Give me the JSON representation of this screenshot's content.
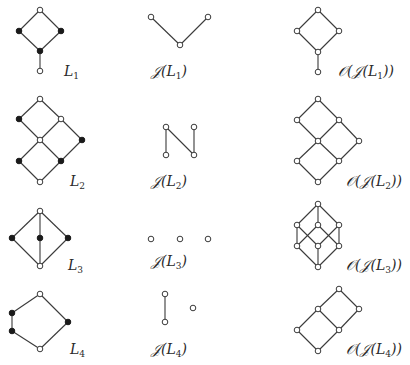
{
  "figure": {
    "rows": [
      {
        "lattice": {
          "name": "L_1",
          "label_main": "L",
          "label_sub": "1",
          "label_pos": [
            64,
            64
          ],
          "nodes": [
            {
              "x": 40,
              "y": 10,
              "filled": false
            },
            {
              "x": 19,
              "y": 31,
              "filled": true
            },
            {
              "x": 61,
              "y": 31,
              "filled": true
            },
            {
              "x": 40,
              "y": 51,
              "filled": true
            },
            {
              "x": 40,
              "y": 71,
              "filled": false
            }
          ],
          "edges": [
            [
              0,
              1
            ],
            [
              0,
              2
            ],
            [
              1,
              3
            ],
            [
              2,
              3
            ],
            [
              3,
              4
            ]
          ]
        },
        "join_irreducibles": {
          "label_prefix": "𝒥(L",
          "label_sub": "1",
          "label_suffix": ")",
          "label_pos": [
            151,
            64
          ],
          "nodes": [
            {
              "x": 151,
              "y": 17,
              "filled": false
            },
            {
              "x": 180,
              "y": 45,
              "filled": false
            },
            {
              "x": 208,
              "y": 17,
              "filled": false
            }
          ],
          "edges": [
            [
              0,
              1
            ],
            [
              1,
              2
            ]
          ]
        },
        "down_sets": {
          "label_prefix": "𝒪(𝒥(L",
          "label_sub": "1",
          "label_suffix": "))",
          "label_pos": [
            338,
            64
          ],
          "nodes": [
            {
              "x": 318,
              "y": 10,
              "filled": false
            },
            {
              "x": 297,
              "y": 31,
              "filled": false
            },
            {
              "x": 339,
              "y": 31,
              "filled": false
            },
            {
              "x": 318,
              "y": 52,
              "filled": false
            },
            {
              "x": 318,
              "y": 72,
              "filled": false
            }
          ],
          "edges": [
            [
              0,
              1
            ],
            [
              0,
              2
            ],
            [
              1,
              3
            ],
            [
              2,
              3
            ],
            [
              3,
              4
            ]
          ]
        }
      },
      {
        "lattice": {
          "name": "L_2",
          "label_main": "L",
          "label_sub": "2",
          "label_pos": [
            70,
            174
          ],
          "nodes": [
            {
              "x": 40,
              "y": 99,
              "filled": false
            },
            {
              "x": 19,
              "y": 119,
              "filled": true
            },
            {
              "x": 61,
              "y": 119,
              "filled": false
            },
            {
              "x": 40,
              "y": 140,
              "filled": false
            },
            {
              "x": 82,
              "y": 140,
              "filled": true
            },
            {
              "x": 19,
              "y": 161,
              "filled": true
            },
            {
              "x": 61,
              "y": 161,
              "filled": true
            },
            {
              "x": 40,
              "y": 182,
              "filled": false
            }
          ],
          "edges": [
            [
              0,
              1
            ],
            [
              0,
              2
            ],
            [
              1,
              3
            ],
            [
              2,
              3
            ],
            [
              2,
              4
            ],
            [
              3,
              5
            ],
            [
              3,
              6
            ],
            [
              4,
              6
            ],
            [
              5,
              7
            ],
            [
              6,
              7
            ]
          ]
        },
        "join_irreducibles": {
          "label_prefix": "𝒥(L",
          "label_sub": "2",
          "label_suffix": ")",
          "label_pos": [
            151,
            174
          ],
          "nodes": [
            {
              "x": 166,
              "y": 127,
              "filled": false
            },
            {
              "x": 194,
              "y": 127,
              "filled": false
            },
            {
              "x": 166,
              "y": 155,
              "filled": false
            },
            {
              "x": 194,
              "y": 155,
              "filled": false
            }
          ],
          "edges": [
            [
              0,
              2
            ],
            [
              0,
              3
            ],
            [
              1,
              3
            ]
          ]
        },
        "down_sets": {
          "label_prefix": "𝒪(𝒥(L",
          "label_sub": "2",
          "label_suffix": "))",
          "label_pos": [
            346,
            174
          ],
          "nodes": [
            {
              "x": 318,
              "y": 99,
              "filled": false
            },
            {
              "x": 297,
              "y": 120,
              "filled": false
            },
            {
              "x": 339,
              "y": 120,
              "filled": false
            },
            {
              "x": 318,
              "y": 141,
              "filled": false
            },
            {
              "x": 359,
              "y": 141,
              "filled": false
            },
            {
              "x": 297,
              "y": 161,
              "filled": false
            },
            {
              "x": 339,
              "y": 161,
              "filled": false
            },
            {
              "x": 318,
              "y": 182,
              "filled": false
            }
          ],
          "edges": [
            [
              0,
              1
            ],
            [
              0,
              2
            ],
            [
              1,
              3
            ],
            [
              2,
              3
            ],
            [
              2,
              4
            ],
            [
              3,
              5
            ],
            [
              3,
              6
            ],
            [
              4,
              6
            ],
            [
              5,
              7
            ],
            [
              6,
              7
            ]
          ]
        }
      },
      {
        "lattice": {
          "name": "L_3",
          "label_main": "L",
          "label_sub": "3",
          "label_pos": [
            68,
            258
          ],
          "nodes": [
            {
              "x": 40,
              "y": 211,
              "filled": false
            },
            {
              "x": 12,
              "y": 238,
              "filled": true
            },
            {
              "x": 40,
              "y": 238,
              "filled": true
            },
            {
              "x": 68,
              "y": 238,
              "filled": true
            },
            {
              "x": 40,
              "y": 266,
              "filled": false
            }
          ],
          "edges": [
            [
              0,
              1
            ],
            [
              0,
              2
            ],
            [
              0,
              3
            ],
            [
              1,
              4
            ],
            [
              2,
              4
            ],
            [
              3,
              4
            ]
          ]
        },
        "join_irreducibles": {
          "label_prefix": "𝒥(L",
          "label_sub": "3",
          "label_suffix": ")",
          "label_pos": [
            151,
            254
          ],
          "nodes": [
            {
              "x": 151,
              "y": 239,
              "filled": false
            },
            {
              "x": 180,
              "y": 239,
              "filled": false
            },
            {
              "x": 208,
              "y": 239,
              "filled": false
            }
          ],
          "edges": []
        },
        "down_sets": {
          "label_prefix": "𝒪(𝒥(L",
          "label_sub": "3",
          "label_suffix": "))",
          "label_pos": [
            346,
            258
          ],
          "nodes": [
            {
              "x": 318,
              "y": 204,
              "filled": false
            },
            {
              "x": 297,
              "y": 225,
              "filled": false
            },
            {
              "x": 318,
              "y": 225,
              "filled": false
            },
            {
              "x": 339,
              "y": 225,
              "filled": false
            },
            {
              "x": 297,
              "y": 246,
              "filled": false
            },
            {
              "x": 318,
              "y": 246,
              "filled": false
            },
            {
              "x": 339,
              "y": 246,
              "filled": false
            },
            {
              "x": 318,
              "y": 267,
              "filled": false
            }
          ],
          "edges": [
            [
              0,
              1
            ],
            [
              0,
              2
            ],
            [
              0,
              3
            ],
            [
              1,
              4
            ],
            [
              1,
              5
            ],
            [
              2,
              4
            ],
            [
              2,
              6
            ],
            [
              3,
              5
            ],
            [
              3,
              6
            ],
            [
              4,
              7
            ],
            [
              5,
              7
            ],
            [
              6,
              7
            ]
          ]
        }
      },
      {
        "lattice": {
          "name": "L_4",
          "label_main": "L",
          "label_sub": "4",
          "label_pos": [
            70,
            342
          ],
          "nodes": [
            {
              "x": 40,
              "y": 294,
              "filled": false
            },
            {
              "x": 12,
              "y": 313,
              "filled": true
            },
            {
              "x": 12,
              "y": 331,
              "filled": true
            },
            {
              "x": 68,
              "y": 322,
              "filled": true
            },
            {
              "x": 40,
              "y": 349,
              "filled": false
            }
          ],
          "edges": [
            [
              0,
              1
            ],
            [
              1,
              2
            ],
            [
              2,
              4
            ],
            [
              0,
              3
            ],
            [
              3,
              4
            ]
          ]
        },
        "join_irreducibles": {
          "label_prefix": "𝒥(L",
          "label_sub": "4",
          "label_suffix": ")",
          "label_pos": [
            151,
            342
          ],
          "nodes": [
            {
              "x": 165,
              "y": 294,
              "filled": false
            },
            {
              "x": 165,
              "y": 322,
              "filled": false
            },
            {
              "x": 193,
              "y": 308,
              "filled": false
            }
          ],
          "edges": [
            [
              0,
              1
            ]
          ]
        },
        "down_sets": {
          "label_prefix": "𝒪(𝒥(L",
          "label_sub": "4",
          "label_suffix": "))",
          "label_pos": [
            346,
            342
          ],
          "nodes": [
            {
              "x": 339,
              "y": 289,
              "filled": false
            },
            {
              "x": 318,
              "y": 309,
              "filled": false
            },
            {
              "x": 359,
              "y": 309,
              "filled": false
            },
            {
              "x": 297,
              "y": 330,
              "filled": false
            },
            {
              "x": 339,
              "y": 330,
              "filled": false
            },
            {
              "x": 318,
              "y": 351,
              "filled": false
            }
          ],
          "edges": [
            [
              0,
              1
            ],
            [
              0,
              2
            ],
            [
              1,
              3
            ],
            [
              1,
              4
            ],
            [
              2,
              4
            ],
            [
              3,
              5
            ],
            [
              4,
              5
            ]
          ]
        }
      }
    ]
  },
  "style": {
    "edge_color": "#3a3a3a",
    "filled_node_color": "#1a1a1a",
    "open_node_fill": "#ffffff",
    "node_radius": 2.8
  }
}
